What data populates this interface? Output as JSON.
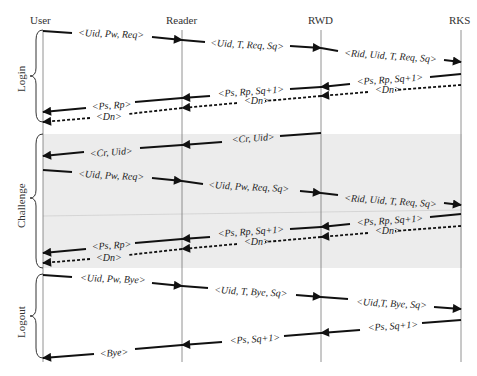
{
  "actors": [
    {
      "id": "user",
      "label": "User",
      "x": 43
    },
    {
      "id": "reader",
      "label": "Reader",
      "x": 182
    },
    {
      "id": "rwd",
      "label": "RWD",
      "x": 321
    },
    {
      "id": "rks",
      "label": "RKS",
      "x": 461
    }
  ],
  "phases": [
    {
      "id": "login",
      "label": "Login"
    },
    {
      "id": "challenge",
      "label": "Challenge"
    },
    {
      "id": "logout",
      "label": "Logout"
    }
  ],
  "messages": {
    "login": [
      "<Uid, Pw, Req>",
      "<Uid, T, Req, Sq>",
      "<Rid, Uid, T, Req, Sq>",
      "<Ps, Rp, Sq+1>",
      "<Dn>",
      "<Ps, Rp, Sq+1>",
      "<Dn>",
      "<Ps, Rp>",
      "<Dn>"
    ],
    "challenge": [
      "<Cr, Uid>",
      "<Cr, Uid>",
      "<Uid, Pw, Req>",
      "<Uid, Pw, Req, Sq>",
      "<Rid, Uid, T, Req, Sq>",
      "<Ps, Rp, Sq+1>",
      "<Dn>",
      "<Ps, Rp, Sq+1>",
      "<Dn>",
      "<Ps, Rp>",
      "<Dn>"
    ],
    "logout": [
      "<Uid, Pw, Bye>",
      "<Uid, T, Bye, Sq>",
      "<Uid,T, Bye, Sq>",
      "<Ps, Sq+1>",
      "<Ps, Sq+1>",
      "<Bye>"
    ]
  },
  "colors": {
    "shade": "#ebebeb",
    "line": "#111111"
  }
}
